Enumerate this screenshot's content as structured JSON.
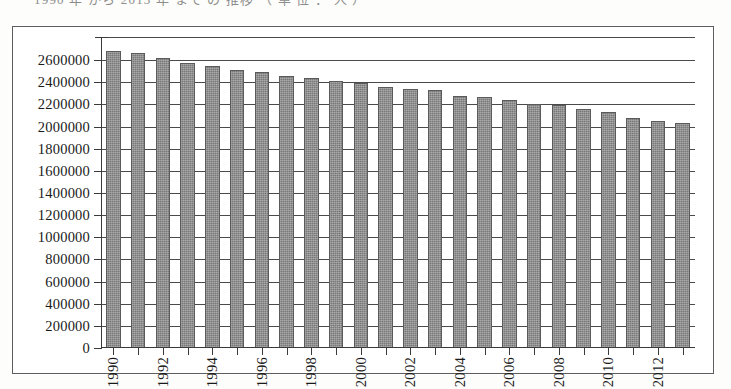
{
  "caption_remnant": "1990 年 から 2013 年 まで の 推移 （ 単 位 ： 人 ）",
  "colors": {
    "bar_fill": "#787878",
    "bar_border": "#5a5a5a",
    "gridline": "#4a4a4a",
    "axis": "#3a3a3a",
    "frame": "#5d5d5d",
    "background": "#ffffff"
  },
  "chart_data": {
    "type": "bar",
    "title": "",
    "subtitle": "",
    "xlabel": "",
    "ylabel": "",
    "grid": true,
    "legend": "none",
    "ylim": [
      0,
      2700000
    ],
    "ytick_values": [
      0,
      200000,
      400000,
      600000,
      800000,
      1000000,
      1200000,
      1400000,
      1600000,
      1800000,
      2000000,
      2200000,
      2400000,
      2600000
    ],
    "ytick_labels": [
      "0",
      "200000",
      "400000",
      "600000",
      "800000",
      "1000000",
      "1200000",
      "1400000",
      "1600000",
      "1800000",
      "2000000",
      "2200000",
      "2400000",
      "2600000"
    ],
    "categories": [
      "1990",
      "1991",
      "1992",
      "1993",
      "1994",
      "1995",
      "1996",
      "1997",
      "1998",
      "1999",
      "2000",
      "2001",
      "2002",
      "2003",
      "2004",
      "2005",
      "2006",
      "2007",
      "2008",
      "2009",
      "2010",
      "2011",
      "2012",
      "2013"
    ],
    "xtick_labels_shown": [
      "1990",
      "1992",
      "1994",
      "1996",
      "1998",
      "2000",
      "2002",
      "2004",
      "2006",
      "2008",
      "2010",
      "2012"
    ],
    "values": [
      2680000,
      2660000,
      2620000,
      2570000,
      2550000,
      2510000,
      2490000,
      2460000,
      2440000,
      2410000,
      2390000,
      2360000,
      2340000,
      2330000,
      2280000,
      2270000,
      2240000,
      2200000,
      2190000,
      2160000,
      2130000,
      2080000,
      2050000,
      2030000
    ]
  }
}
